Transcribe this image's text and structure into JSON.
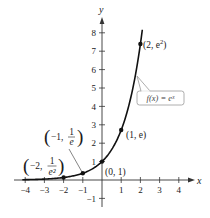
{
  "chart_data": {
    "type": "line",
    "title": "",
    "function": "f(x) = e^x",
    "xlabel": "x",
    "ylabel": "y",
    "xlim": [
      -4.2,
      4.8
    ],
    "ylim": [
      -1.4,
      8.6
    ],
    "grid": false,
    "x_ticks": [
      -4,
      -3,
      -2,
      -1,
      1,
      2,
      3,
      4
    ],
    "x_tick_labels": [
      "−4",
      "−3",
      "−2",
      "−1",
      "1",
      "2",
      "3",
      "4"
    ],
    "y_ticks": [
      -1,
      1,
      2,
      3,
      4,
      5,
      6,
      7,
      8
    ],
    "y_tick_labels": [
      "−1",
      "1",
      "2",
      "3",
      "4",
      "5",
      "6",
      "7",
      "8"
    ],
    "series": [
      {
        "name": "f(x) = e^x",
        "x": [
          -4.2,
          -4,
          -3,
          -2,
          -1,
          0,
          1,
          1.5,
          2,
          2.1
        ],
        "y": [
          0.015,
          0.018,
          0.05,
          0.135,
          0.368,
          1.0,
          2.718,
          4.482,
          7.389,
          8.166
        ]
      }
    ],
    "marked_points": [
      {
        "x": -2,
        "y": 0.135,
        "label": "(−2, 1/e²)"
      },
      {
        "x": -1,
        "y": 0.368,
        "label": "(−1, 1/e)"
      },
      {
        "x": 0,
        "y": 1,
        "label": "(0, 1)"
      },
      {
        "x": 1,
        "y": 2.718,
        "label": "(1, e)"
      },
      {
        "x": 2,
        "y": 7.389,
        "label": "(2, e²)"
      }
    ],
    "annotations": [
      {
        "text": "f(x) = e^x",
        "type": "callout-box"
      }
    ]
  },
  "labels": {
    "x_axis": "x",
    "y_axis": "y",
    "callout": "f(x) = eˣ",
    "p_neg2": {
      "open": "(",
      "main": "−2,",
      "num": "1",
      "den": "e²",
      "close": ")"
    },
    "p_neg1": {
      "open": "(",
      "main": "−1,",
      "num": "1",
      "den": "e",
      "close": ")"
    },
    "p_0": "(0, 1)",
    "p_1": "(1, e)",
    "p_2_main": "(2, e",
    "p_2_sup": "2",
    "p_2_close": ")"
  }
}
